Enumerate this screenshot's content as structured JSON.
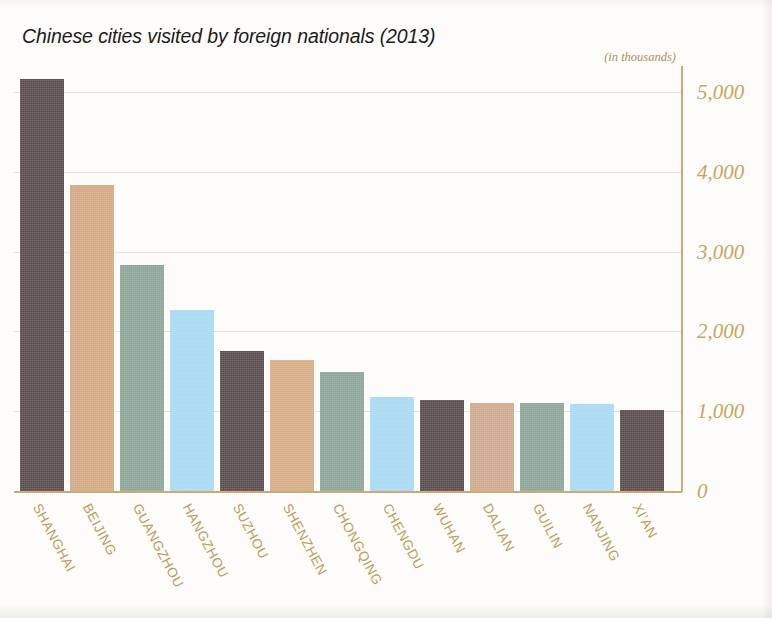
{
  "chart_data": {
    "type": "bar",
    "title": "Chinese cities visited by foreign nationals (2013)",
    "subtitle": "(in thousands)",
    "xlabel": "",
    "ylabel": "",
    "unit_note": "(in thousands)",
    "ylim": [
      0,
      5400
    ],
    "grid": true,
    "legend": "none",
    "y_ticks": [
      0,
      1000,
      2000,
      3000,
      4000,
      5000
    ],
    "y_tick_labels": [
      "0",
      "1,000",
      "2,000",
      "3,000",
      "4,000",
      "5,000"
    ],
    "categories": [
      "SHANGHAI",
      "BEIJING",
      "GUANGZHOU",
      "HANGZHOU",
      "SUZHOU",
      "SHENZHEN",
      "CHONGQING",
      "CHENGDU",
      "WUHAN",
      "DALIAN",
      "GUILIN",
      "NANJING",
      "XI'AN"
    ],
    "values": [
      5160,
      3840,
      2830,
      2270,
      1760,
      1640,
      1490,
      1180,
      1140,
      1100,
      1100,
      1090,
      1020
    ],
    "bar_colors": [
      "#584a4c",
      "#d3a983",
      "#8ba497",
      "#a9d9f2",
      "#584a4c",
      "#d6ad85",
      "#8ba497",
      "#a9d9f2",
      "#584a4c",
      "#cfa98e",
      "#8ba497",
      "#a9d9f2",
      "#584a4c"
    ]
  },
  "colors": {
    "axis": "#cda97a",
    "tick_text": "#c9a45f",
    "category_text": "#c09a59",
    "gridline": "#dfe3e8",
    "title_text": "#1b1b1b",
    "background": "#fdfcfa",
    "dark_bar": "#584a4c",
    "tan_bar": "#d3a983",
    "green_bar": "#8ba497",
    "blue_bar": "#a9d9f2"
  }
}
